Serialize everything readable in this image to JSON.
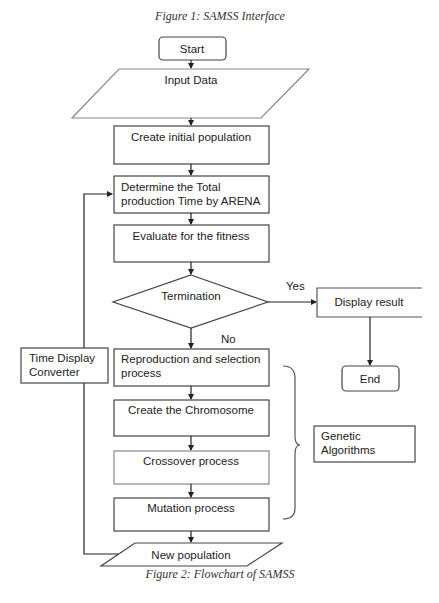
{
  "captions": {
    "top": "Figure 1: SAMSS Interface",
    "bottom": "Figure 2: Flowchart of SAMSS"
  },
  "nodes": {
    "start": "Start",
    "input_data": "Input Data",
    "create_initial_population": "Create initial population",
    "determine_line1": "Determine the Total",
    "determine_line2": "production Time by ARENA",
    "evaluate": "Evaluate for the fitness",
    "termination": "Termination",
    "display_result": "Display result",
    "end": "End",
    "reproduction_line1": "Reproduction and selection",
    "reproduction_line2": "process",
    "create_chromosome": "Create the Chromosome",
    "crossover": "Crossover process",
    "mutation": "Mutation process",
    "new_population": "New population",
    "time_display_line1": "Time Display",
    "time_display_line2": "Converter",
    "genetic_line1": "Genetic",
    "genetic_line2": "Algorithms"
  },
  "edges": {
    "yes_label": "Yes",
    "no_label": "No"
  },
  "colors": {
    "stroke": "#444444",
    "text": "#222222",
    "background": "#ffffff"
  }
}
